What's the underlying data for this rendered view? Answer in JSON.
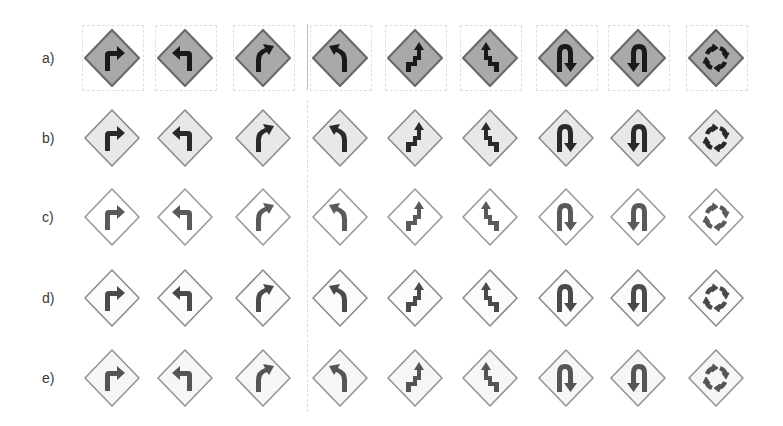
{
  "figure": {
    "rows": [
      {
        "label": "a)",
        "style": "dark-fill",
        "fill": "#a9a9a9",
        "border": "#6a6a6a",
        "symbol": "#1a1a1a"
      },
      {
        "label": "b)",
        "style": "light-fill",
        "fill": "#e8e8e8",
        "border": "#8a8a8a",
        "symbol": "#2a2a2a"
      },
      {
        "label": "c)",
        "style": "outline",
        "fill": "#ffffff",
        "border": "#9a9a9a",
        "symbol": "#5a5a5a"
      },
      {
        "label": "d)",
        "style": "outline-speckle",
        "fill": "#fbfbfb",
        "border": "#8c8c8c",
        "symbol": "#4a4a4a"
      },
      {
        "label": "e)",
        "style": "outline-noise",
        "fill": "#f6f6f6",
        "border": "#959595",
        "symbol": "#555555"
      }
    ],
    "columns": [
      {
        "sign": "turn-right",
        "icon": "turn-right-arrow-icon"
      },
      {
        "sign": "turn-left",
        "icon": "turn-left-arrow-icon"
      },
      {
        "sign": "curve-right",
        "icon": "curve-right-arrow-icon"
      },
      {
        "sign": "curve-left",
        "icon": "curve-left-arrow-icon"
      },
      {
        "sign": "reverse-turn-right",
        "icon": "reverse-turn-right-icon"
      },
      {
        "sign": "reverse-turn-left",
        "icon": "reverse-turn-left-icon"
      },
      {
        "sign": "u-turn-right",
        "icon": "u-turn-right-icon"
      },
      {
        "sign": "u-turn-left",
        "icon": "u-turn-left-icon"
      },
      {
        "sign": "roundabout",
        "icon": "roundabout-icon"
      }
    ]
  }
}
